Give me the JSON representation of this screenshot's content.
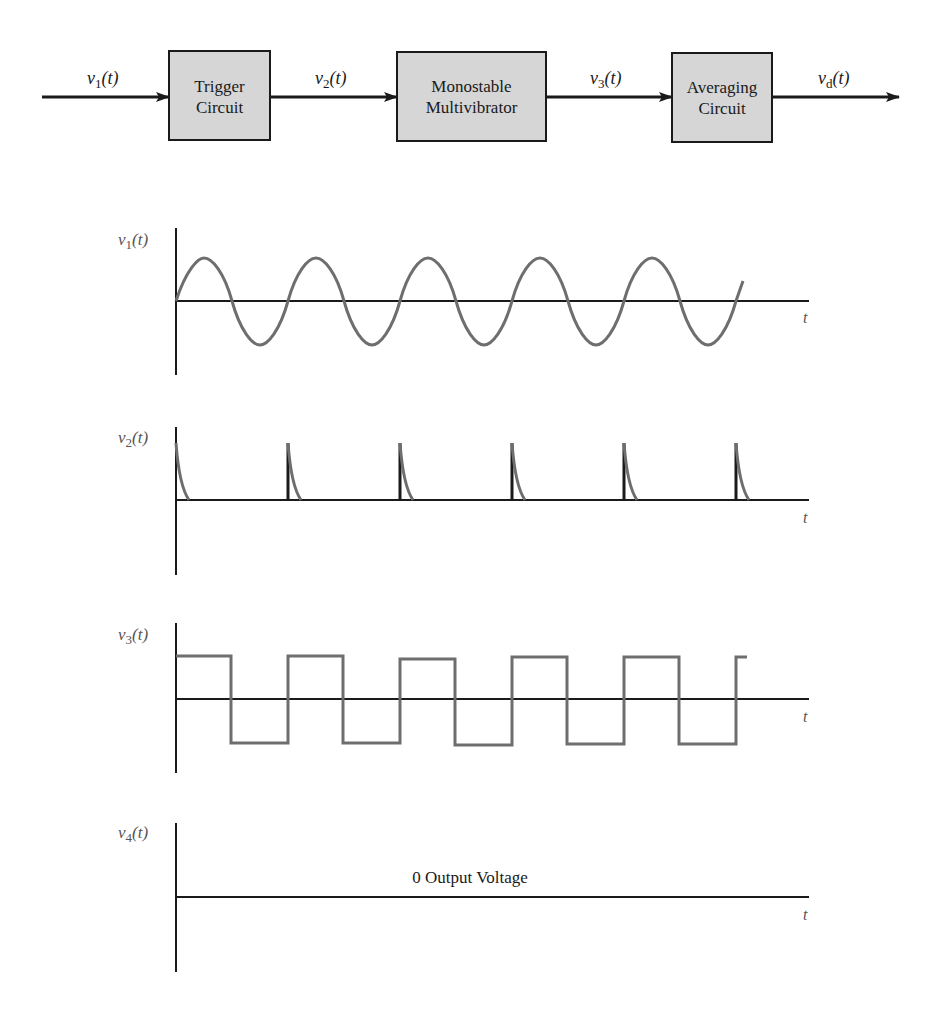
{
  "block_diagram": {
    "blocks": [
      {
        "line1": "Trigger",
        "line2": "Circuit"
      },
      {
        "line1": "Monostable",
        "line2": "Multivibrator"
      },
      {
        "line1": "Averaging",
        "line2": "Circuit"
      }
    ],
    "signals": [
      {
        "base": "v",
        "sub": "1",
        "arg": "(t)"
      },
      {
        "base": "v",
        "sub": "2",
        "arg": "(t)"
      },
      {
        "base": "v",
        "sub": "3",
        "arg": "(t)"
      },
      {
        "base": "v",
        "sub": "d",
        "arg": "(t)"
      }
    ],
    "colors": {
      "block_fill": "#d6d6d6",
      "line": "#1a1a1a"
    }
  },
  "plots": [
    {
      "ylabel_base": "v",
      "ylabel_sub": "1",
      "ylabel_arg": "(t)",
      "xlabel": "t",
      "waveform": "sine"
    },
    {
      "ylabel_base": "v",
      "ylabel_sub": "2",
      "ylabel_arg": "(t)",
      "xlabel": "t",
      "waveform": "trigger-spikes"
    },
    {
      "ylabel_base": "v",
      "ylabel_sub": "3",
      "ylabel_arg": "(t)",
      "xlabel": "t",
      "waveform": "square"
    },
    {
      "ylabel_base": "v",
      "ylabel_sub": "4",
      "ylabel_arg": "(t)",
      "xlabel": "t",
      "waveform": "zero",
      "annotation": "0 Output Voltage"
    }
  ],
  "colors": {
    "waveform": "#6e6e6e",
    "axis": "#1a1a1a",
    "label_gray": "#555555"
  }
}
